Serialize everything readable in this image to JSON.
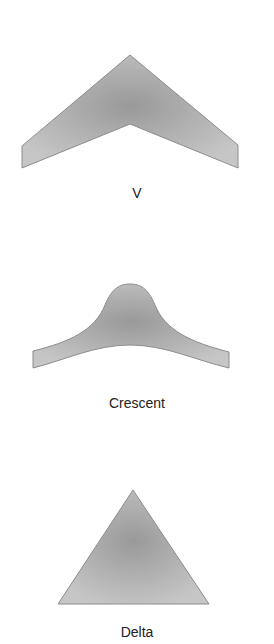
{
  "shapes": [
    {
      "name": "V",
      "label": "V"
    },
    {
      "name": "Crescent",
      "label": "Crescent"
    },
    {
      "name": "Delta",
      "label": "Delta"
    }
  ],
  "colors": {
    "fill_center": "#9a9a9a",
    "fill_edge": "#c4c4c4",
    "stroke": "#8a8a8a"
  }
}
